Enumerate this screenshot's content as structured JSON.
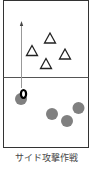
{
  "caption": "サイド攻撃作戦",
  "colors": {
    "border": "#333333",
    "midline": "#555555",
    "arrow": "#888888",
    "triangle_stroke": "#222222",
    "circle_fill": "#808080",
    "ball": "#000000"
  },
  "legend_semantics": {
    "triangles": "opponent players",
    "gray_circles": "own team players",
    "ring": "ball"
  },
  "counts": {
    "triangles": 4,
    "gray_circles": 4,
    "balls": 1
  }
}
